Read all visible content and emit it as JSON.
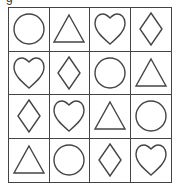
{
  "top_label": "g",
  "grid": {
    "rows": 4,
    "cols": 4,
    "cells": [
      [
        "circle",
        "triangle",
        "heart",
        "diamond"
      ],
      [
        "heart",
        "diamond",
        "circle",
        "triangle"
      ],
      [
        "diamond",
        "heart",
        "triangle",
        "circle"
      ],
      [
        "triangle",
        "circle",
        "diamond",
        "heart"
      ]
    ]
  },
  "colors": {
    "line": "#444444",
    "background": "#ffffff"
  }
}
